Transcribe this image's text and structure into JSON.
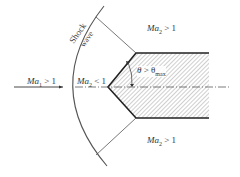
{
  "diagram": {
    "type": "detached shock wave over wedge",
    "labels": {
      "upstream": {
        "var": "Ma",
        "sub": "1",
        "rel": " > 1"
      },
      "behind_shock": {
        "var": "Ma",
        "sub": "2",
        "rel": " < 1"
      },
      "upper_downstream": {
        "var": "Ma",
        "sub": "2",
        "rel": " > 1"
      },
      "lower_downstream": {
        "var": "Ma",
        "sub": "2",
        "rel": " > 1"
      },
      "angle": {
        "var": "θ",
        "rel": " > θ",
        "sub": "max"
      },
      "shock_word1": "Shock",
      "shock_word2": "wave"
    },
    "colors": {
      "line": "#333333",
      "shock": "#555555",
      "hatch": "#888888"
    }
  }
}
